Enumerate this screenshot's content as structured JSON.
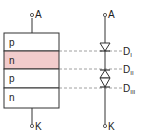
{
  "diagram": {
    "structure": {
      "terminal_top": "A",
      "terminal_bottom": "K",
      "layers": [
        {
          "label": "p",
          "fill": "#ffffff"
        },
        {
          "label": "n",
          "fill": "#f2cccc"
        },
        {
          "label": "p",
          "fill": "#ffffff"
        },
        {
          "label": "n",
          "fill": "#ffffff"
        }
      ]
    },
    "equivalent": {
      "terminal_top": "A",
      "terminal_bottom": "K",
      "diodes": [
        {
          "label": "D",
          "sub": "I"
        },
        {
          "label": "D",
          "sub": "II"
        },
        {
          "label": "D",
          "sub": "III"
        }
      ]
    },
    "colors": {
      "line": "#333333",
      "dash": "#888888",
      "highlight": "#f2cccc"
    }
  }
}
